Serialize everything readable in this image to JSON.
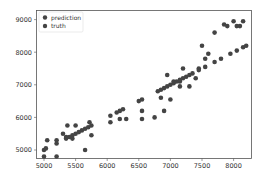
{
  "chart_data": {
    "type": "scatter",
    "title": "",
    "xlabel": "",
    "ylabel": "",
    "xlim": [
      4880,
      8320
    ],
    "ylim": [
      4750,
      9300
    ],
    "xticks": [
      5000,
      5500,
      6000,
      6500,
      7000,
      7500,
      8000
    ],
    "yticks": [
      5000,
      6000,
      7000,
      8000,
      9000
    ],
    "xtick_labels": [
      "5000",
      "5500",
      "6000",
      "6500",
      "7000",
      "7500",
      "8000"
    ],
    "ytick_labels": [
      "5000",
      "6000",
      "7000",
      "8000",
      "9000"
    ],
    "grid": false,
    "legend_position": "upper left",
    "series": [
      {
        "name": "prediction",
        "color": "#444444",
        "points": [
          [
            5000,
            4800
          ],
          [
            5050,
            5300
          ],
          [
            5200,
            4800
          ],
          [
            5200,
            5300
          ],
          [
            5350,
            5400
          ],
          [
            5370,
            5750
          ],
          [
            5500,
            5750
          ],
          [
            5650,
            5000
          ],
          [
            5750,
            5450
          ],
          [
            5720,
            5850
          ],
          [
            6050,
            5850
          ],
          [
            6050,
            6050
          ],
          [
            6200,
            5950
          ],
          [
            6300,
            5950
          ],
          [
            6550,
            5950
          ],
          [
            6550,
            6200
          ],
          [
            6750,
            6000
          ],
          [
            6900,
            6200
          ],
          [
            6850,
            6600
          ],
          [
            7000,
            6550
          ],
          [
            6950,
            7300
          ],
          [
            7150,
            7100
          ],
          [
            7200,
            7500
          ],
          [
            7300,
            6950
          ],
          [
            7400,
            7200
          ],
          [
            7450,
            7500
          ],
          [
            7550,
            7800
          ],
          [
            7500,
            8200
          ],
          [
            7600,
            7950
          ],
          [
            7700,
            8600
          ],
          [
            7850,
            8850
          ],
          [
            8000,
            8950
          ],
          [
            8100,
            8800
          ],
          [
            8150,
            8950
          ],
          [
            7900,
            8800
          ],
          [
            8050,
            8800
          ],
          [
            7150,
            6950
          ],
          [
            7050,
            7100
          ],
          [
            7250,
            7250
          ],
          [
            5450,
            5350
          ],
          [
            5300,
            5500
          ]
        ]
      },
      {
        "name": "truth",
        "color": "#444444",
        "points": [
          [
            5000,
            5000
          ],
          [
            5030,
            5050
          ],
          [
            5200,
            5200
          ],
          [
            5350,
            5350
          ],
          [
            5400,
            5400
          ],
          [
            5450,
            5450
          ],
          [
            5500,
            5500
          ],
          [
            5550,
            5550
          ],
          [
            5600,
            5600
          ],
          [
            5650,
            5650
          ],
          [
            5700,
            5700
          ],
          [
            5750,
            5750
          ],
          [
            6150,
            6150
          ],
          [
            6200,
            6200
          ],
          [
            6250,
            6250
          ],
          [
            6500,
            6500
          ],
          [
            6550,
            6550
          ],
          [
            6800,
            6800
          ],
          [
            6850,
            6850
          ],
          [
            6900,
            6900
          ],
          [
            6950,
            6950
          ],
          [
            7000,
            7000
          ],
          [
            7050,
            7050
          ],
          [
            7100,
            7100
          ],
          [
            7150,
            7150
          ],
          [
            7200,
            7200
          ],
          [
            7300,
            7300
          ],
          [
            7350,
            7350
          ],
          [
            7450,
            7450
          ],
          [
            7550,
            7550
          ],
          [
            7700,
            7700
          ],
          [
            7800,
            7800
          ],
          [
            7950,
            7950
          ],
          [
            8050,
            8050
          ],
          [
            8150,
            8150
          ],
          [
            8200,
            8200
          ]
        ]
      }
    ]
  },
  "legend": {
    "items": [
      {
        "label": "prediction",
        "color": "#444444"
      },
      {
        "label": "truth",
        "color": "#444444"
      }
    ]
  }
}
